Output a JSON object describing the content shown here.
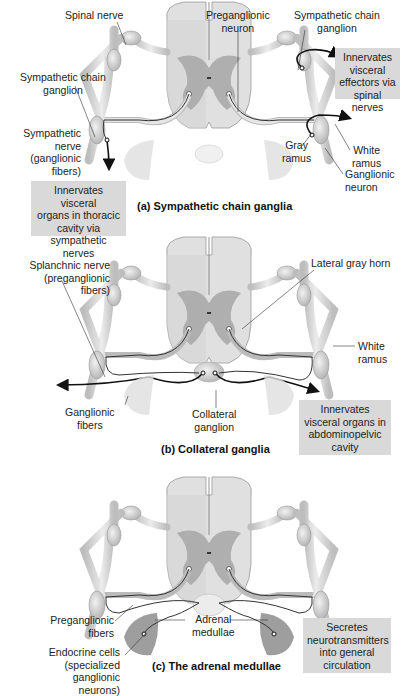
{
  "figure": {
    "panels": [
      {
        "id": "a",
        "title": "(a) Sympathetic chain ganglia",
        "labels": {
          "spinal_nerve": "Spinal nerve",
          "preganglionic_neuron": [
            "Preganglionic",
            "neuron"
          ],
          "sympathetic_chain_ganglion_right": [
            "Sympathetic chain",
            "ganglion"
          ],
          "sympathetic_chain_ganglion_left": [
            "Sympathetic chain",
            "ganglion"
          ],
          "sympathetic_nerve": [
            "Sympathetic",
            "nerve",
            "(ganglionic",
            "fibers)"
          ],
          "gray_ramus": [
            "Gray",
            "ramus"
          ],
          "white_ramus": [
            "White",
            "ramus"
          ],
          "ganglionic_neuron": [
            "Ganglionic",
            "neuron"
          ]
        },
        "boxes": {
          "visceral_effectors": [
            "Innervates",
            "visceral",
            "effectors via",
            "spinal nerves"
          ],
          "thoracic_organs": [
            "Innervates visceral",
            "organs in thoracic",
            "cavity via",
            "sympathetic nerves"
          ]
        }
      },
      {
        "id": "b",
        "title": "(b) Collateral ganglia",
        "labels": {
          "splanchnic_nerve": [
            "Splanchnic nerve",
            "(preganglionic",
            "fibers)"
          ],
          "lateral_gray_horn": "Lateral gray horn",
          "white_ramus": [
            "White",
            "ramus"
          ],
          "ganglionic_fibers": [
            "Ganglionic",
            "fibers"
          ],
          "collateral_ganglion": [
            "Collateral",
            "ganglion"
          ]
        },
        "boxes": {
          "abdominopelvic": [
            "Innervates",
            "visceral organs in",
            "abdominopelvic",
            "cavity"
          ]
        }
      },
      {
        "id": "c",
        "title": "(c) The adrenal medullae",
        "labels": {
          "preganglionic_fibers": [
            "Preganglionic",
            "fibers"
          ],
          "adrenal_medullae": [
            "Adrenal",
            "medullae"
          ],
          "endocrine_cells": [
            "Endocrine cells",
            "(specialized",
            "ganglionic",
            "neurons)"
          ]
        },
        "boxes": {
          "secretes": [
            "Secretes",
            "neurotransmitters",
            "into general",
            "circulation"
          ]
        }
      }
    ],
    "colors": {
      "box_fill": "#d9d9d9",
      "cord_white_matter": "#e2e2e2",
      "cord_gray_matter": "#a8a8a8",
      "nerve_fill": "#d6d6d6",
      "organ_fill": "#cfcfcf",
      "adrenal_fill": "#9c9c9c",
      "fiber_dark": "#111111"
    }
  }
}
